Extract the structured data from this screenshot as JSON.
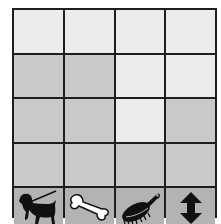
{
  "board": {
    "rows": 4,
    "cols": 4,
    "cells": [
      [
        "light",
        "light",
        "light",
        "light"
      ],
      [
        "dark",
        "dark",
        "light",
        "light"
      ],
      [
        "dark",
        "dark",
        "light",
        "dark"
      ],
      [
        "dark",
        "dark",
        "dark",
        "dark"
      ]
    ],
    "colors": {
      "light": "#ececec",
      "dark": "#c9c9c9",
      "toolbar": "#b3b3b3",
      "grid": "#1e1e1e"
    }
  },
  "toolbar": {
    "items": [
      {
        "name": "dog-on-leash",
        "icon": "dog-icon"
      },
      {
        "name": "bone",
        "icon": "bone-icon"
      },
      {
        "name": "brush",
        "icon": "brush-icon"
      },
      {
        "name": "vertical-arrows",
        "icon": "up-down-arrow-icon"
      }
    ]
  }
}
